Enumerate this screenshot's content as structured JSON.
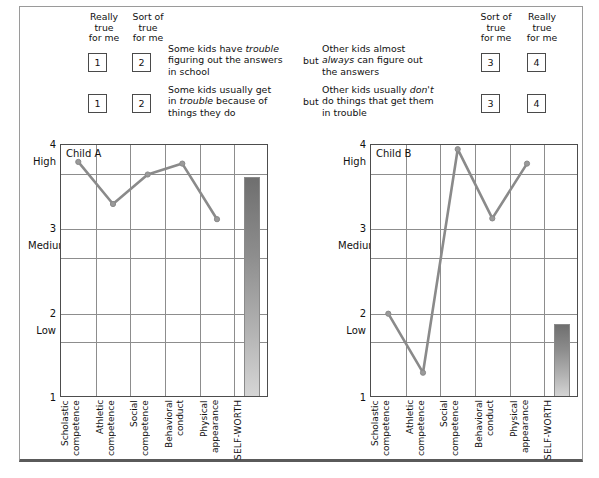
{
  "header": {
    "left_scale": [
      {
        "label": "Really\ntrue\nfor me",
        "number": "1"
      },
      {
        "label": "Sort of\ntrue\nfor me",
        "number": "2"
      }
    ],
    "right_scale": [
      {
        "label": "Sort of\ntrue\nfor me",
        "number": "3"
      },
      {
        "label": "Really\ntrue\nfor me",
        "number": "4"
      }
    ],
    "connector": "but",
    "items": [
      {
        "left_numbers": [
          "1",
          "2"
        ],
        "left_stem_a": "Some kids have ",
        "left_stem_em": "trouble",
        "left_stem_b": "\nfiguring out the answers\nin school",
        "connector": "but",
        "right_stem_a": "Other kids almost\n",
        "right_stem_em": "always",
        "right_stem_b": " can figure out\nthe answers",
        "right_numbers": [
          "3",
          "4"
        ]
      },
      {
        "left_numbers": [
          "1",
          "2"
        ],
        "left_stem_a": "Some kids usually get\nin ",
        "left_stem_em": "trouble",
        "left_stem_b": " because of\nthings they do",
        "connector": "but",
        "right_stem_a": "Other kids usually ",
        "right_stem_em": "don't",
        "right_stem_b": "\ndo things that get them\nin trouble",
        "right_numbers": [
          "3",
          "4"
        ]
      }
    ]
  },
  "chart_data": [
    {
      "type": "line",
      "title": "Child A",
      "xlabel": "",
      "ylabel": "",
      "ylim": [
        1,
        4
      ],
      "yticks": [
        1,
        2,
        3,
        4
      ],
      "ytick_labels": [
        "1",
        "2",
        "3",
        "4"
      ],
      "yband_labels": [
        {
          "text": "High",
          "value": 3.8
        },
        {
          "text": "Medium",
          "value": 2.8
        },
        {
          "text": "Low",
          "value": 1.8
        }
      ],
      "gridlines": [
        1.0,
        1.66,
        2.0,
        2.66,
        3.0,
        3.66,
        4.0
      ],
      "grid": true,
      "categories": [
        "Scholastic\ncompetence",
        "Athletic\ncompetence",
        "Social\ncompetence",
        "Behavioral\nconduct",
        "Physical\nappearance",
        "SELF-WORTH"
      ],
      "values": [
        3.8,
        3.3,
        3.65,
        3.78,
        3.12
      ],
      "bar": {
        "category": "SELF-WORTH",
        "value": 3.62
      },
      "legend_position": "none"
    },
    {
      "type": "line",
      "title": "Child B",
      "xlabel": "",
      "ylabel": "",
      "ylim": [
        1,
        4
      ],
      "yticks": [
        1,
        2,
        3,
        4
      ],
      "ytick_labels": [
        "1",
        "2",
        "3",
        "4"
      ],
      "yband_labels": [
        {
          "text": "High",
          "value": 3.8
        },
        {
          "text": "Medium",
          "value": 2.8
        },
        {
          "text": "Low",
          "value": 1.8
        }
      ],
      "gridlines": [
        1.0,
        1.66,
        2.0,
        2.66,
        3.0,
        3.66,
        4.0
      ],
      "grid": true,
      "categories": [
        "Scholastic\ncompetence",
        "Athletic\ncompetence",
        "Social\ncompetence",
        "Behavioral\nconduct",
        "Physical\nappearance",
        "SELF-WORTH"
      ],
      "values": [
        2.0,
        1.3,
        3.95,
        3.13,
        3.78
      ],
      "bar": {
        "category": "SELF-WORTH",
        "value": 1.88
      },
      "legend_position": "none"
    }
  ],
  "colors": {
    "line": "#8a8a8a",
    "marker": "#9a9a9a",
    "grid": "#8d8d8d",
    "axis": "#4d4d4d",
    "bar_top": "#6f6f6f",
    "bar_bottom": "#d6d6d6",
    "text": "#111111"
  }
}
